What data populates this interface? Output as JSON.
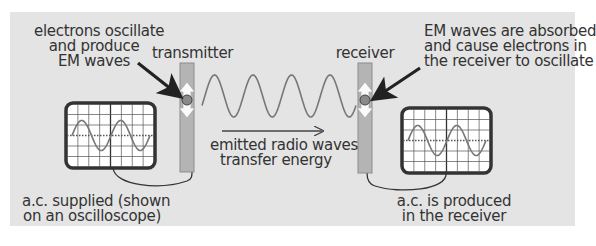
{
  "diagram": {
    "labels": {
      "transmitter": "transmitter",
      "receiver": "receiver",
      "transmitter_note": [
        "electrons oscillate",
        "and produce",
        "EM waves"
      ],
      "receiver_note": [
        "EM waves are absorbed",
        "and cause electrons in",
        "the receiver to oscillate"
      ],
      "wave_note": [
        "emitted radio waves",
        "transfer energy"
      ],
      "ac_supplied": [
        "a.c. supplied (shown",
        "on an oscilloscope)"
      ],
      "ac_produced": [
        "a.c. is produced",
        "in the receiver"
      ]
    },
    "components": [
      {
        "id": "transmitter-oscilloscope",
        "type": "oscilloscope",
        "shows": "sine wave",
        "cycles": 2
      },
      {
        "id": "transmitter-aerial",
        "type": "aerial",
        "contains": "oscillating electron"
      },
      {
        "id": "radio-waves",
        "type": "sine wave",
        "cycles": 4,
        "direction": "left-to-right"
      },
      {
        "id": "receiver-aerial",
        "type": "aerial",
        "contains": "oscillating electron"
      },
      {
        "id": "receiver-oscilloscope",
        "type": "oscilloscope",
        "shows": "sine wave",
        "cycles": 2
      }
    ],
    "colors": {
      "panel": "#e4e4e4",
      "aerial": "#b4b4b4",
      "aerial_border": "#8c8c8c",
      "electron": "#8a8a8a",
      "wave": "#777777",
      "arrow": "#222222",
      "text": "#333333",
      "screen": "#ffffff"
    }
  }
}
